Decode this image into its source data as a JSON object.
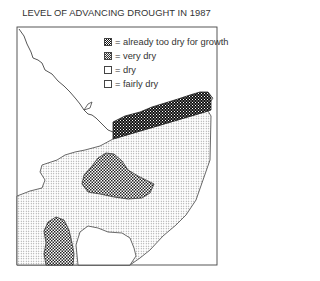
{
  "title": "LEVEL OF ADVANCING DROUGHT IN 1987",
  "legend": {
    "items": [
      {
        "symbol": "dense-black-pattern",
        "label": "= already too dry for growth"
      },
      {
        "symbol": "checker-pattern",
        "label": "= very dry"
      },
      {
        "symbol": "light-dot-pattern",
        "label": "= dry"
      },
      {
        "symbol": "blank",
        "label": "= fairly dry"
      }
    ]
  },
  "map": {
    "regions": [
      {
        "name": "already-too-dry-coastal-strip",
        "category": "already too dry for growth"
      },
      {
        "name": "very-dry-central-zone",
        "category": "very dry"
      },
      {
        "name": "very-dry-southwest-zone",
        "category": "very dry"
      },
      {
        "name": "dry-zone",
        "category": "dry"
      },
      {
        "name": "fairly-dry-zone",
        "category": "fairly dry"
      }
    ],
    "colors": {
      "frame": "#444444",
      "line": "#444444"
    }
  }
}
